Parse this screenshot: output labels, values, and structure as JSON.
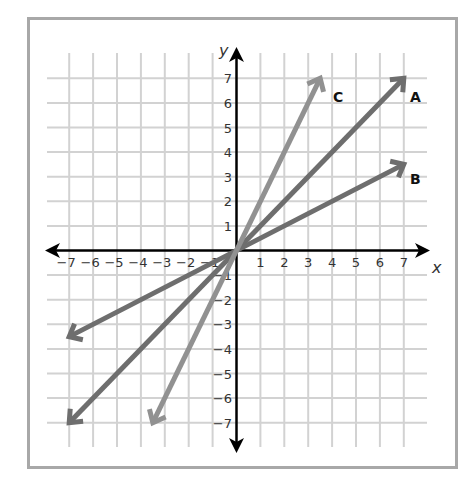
{
  "diagram": {
    "title": "",
    "x_axis_label": "x",
    "y_axis_label": "y",
    "x_ticks": [
      "-7",
      "-6",
      "-5",
      "-4",
      "-3",
      "-2",
      "-1",
      "1",
      "2",
      "3",
      "4",
      "5",
      "6",
      "7"
    ],
    "y_ticks": [
      "7",
      "6",
      "5",
      "4",
      "3",
      "2",
      "1",
      "-1",
      "-2",
      "-3",
      "-4",
      "-5",
      "-6",
      "-7"
    ],
    "lines": [
      {
        "name": "A",
        "label": "A",
        "from": [
          -7,
          -7
        ],
        "to": [
          7,
          7
        ],
        "color": "#6e6e6e",
        "slope": 1
      },
      {
        "name": "B",
        "label": "B",
        "from": [
          -7,
          -3.5
        ],
        "to": [
          7,
          3.5
        ],
        "color": "#6e6e6e",
        "slope": 0.5
      },
      {
        "name": "C",
        "label": "C",
        "from": [
          -3.5,
          -7
        ],
        "to": [
          3.5,
          7
        ],
        "color": "#919191",
        "slope": 2
      }
    ],
    "colors": {
      "grid": "#d2d2d2",
      "axis": "#000000",
      "border": "#a8a8a8"
    }
  },
  "chart_data": {
    "type": "line",
    "title": "",
    "xlabel": "x",
    "ylabel": "y",
    "xlim": [
      -7,
      7
    ],
    "ylim": [
      -7,
      7
    ],
    "grid": true,
    "legend": "inline labels A, B, C at upper-right ends",
    "series": [
      {
        "name": "A",
        "x": [
          -7,
          7
        ],
        "y": [
          -7,
          7
        ]
      },
      {
        "name": "B",
        "x": [
          -7,
          7
        ],
        "y": [
          -3.5,
          3.5
        ]
      },
      {
        "name": "C",
        "x": [
          -3.5,
          3.5
        ],
        "y": [
          -7,
          7
        ]
      }
    ]
  }
}
